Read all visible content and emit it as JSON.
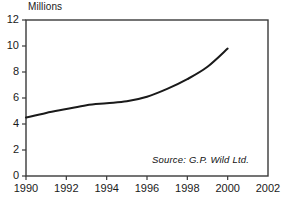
{
  "chart_data": {
    "type": "line",
    "title": "",
    "subtitle": "",
    "ylabel": "Millions",
    "xlabel": "",
    "xlim": [
      1990,
      2002
    ],
    "ylim": [
      0,
      12
    ],
    "grid": false,
    "legend": false,
    "annotations": [
      {
        "name": "source-note",
        "text": "Source: G.P. Wild Ltd."
      }
    ],
    "xticks": [
      "1990",
      "1992",
      "1994",
      "1996",
      "1998",
      "2000",
      "2002"
    ],
    "xtick_values": [
      1990,
      1992,
      1994,
      1996,
      1998,
      2000,
      2002
    ],
    "yticks": [
      "0",
      "2",
      "4",
      "6",
      "8",
      "10",
      "12"
    ],
    "ytick_values": [
      0,
      2,
      4,
      6,
      8,
      10,
      12
    ],
    "series": [
      {
        "name": "Passengers",
        "color": "#1a1a1a",
        "x": [
          1990,
          1991,
          1992,
          1993,
          1994,
          1995,
          1996,
          1997,
          1998,
          1999,
          2000
        ],
        "values": [
          4.5,
          4.85,
          5.15,
          5.45,
          5.6,
          5.75,
          6.1,
          6.7,
          7.45,
          8.4,
          9.8
        ]
      }
    ]
  },
  "axes": {
    "ylabel": "Millions",
    "source": "Source: G.P. Wild Ltd."
  }
}
